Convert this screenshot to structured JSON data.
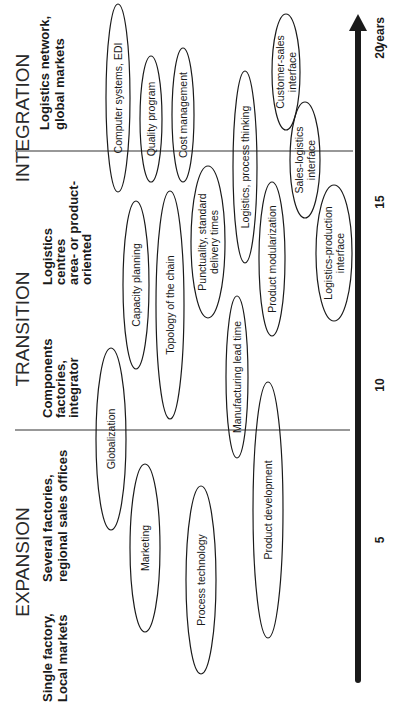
{
  "phases": [
    {
      "id": "expansion",
      "label": "EXPANSION"
    },
    {
      "id": "transition",
      "label": "TRANSITION"
    },
    {
      "id": "integration",
      "label": "INTEGRATION"
    }
  ],
  "stages": [
    {
      "id": "single-factory",
      "lines": [
        "Single  factory,",
        "Local markets"
      ]
    },
    {
      "id": "several-factories",
      "lines": [
        "Several factories,",
        "regional sales offices"
      ]
    },
    {
      "id": "components-factories",
      "lines": [
        "Components",
        "factories,",
        "integrator"
      ]
    },
    {
      "id": "logistics-centres",
      "lines": [
        "Logistics",
        "centres",
        "area- or product-",
        "oriented"
      ]
    },
    {
      "id": "logistics-network",
      "lines": [
        "Logistics network,",
        "global markets"
      ]
    }
  ],
  "axis": {
    "unit_label": "years",
    "ticks": [
      "5",
      "10",
      "15",
      "20"
    ],
    "range_years": [
      0,
      21
    ],
    "color": "#1a1a1a"
  },
  "dividers_at_years": [
    9.5,
    17
  ],
  "topics": [
    {
      "id": "computer-systems",
      "lines": [
        "Computer systems, EDI"
      ]
    },
    {
      "id": "quality-program",
      "lines": [
        "Quality program"
      ]
    },
    {
      "id": "cost-management",
      "lines": [
        "Cost management"
      ]
    },
    {
      "id": "logistics-process-thinking",
      "lines": [
        "Logistics, process thinking"
      ]
    },
    {
      "id": "customer-sales-interface",
      "lines": [
        "Customer-sales",
        "interface"
      ]
    },
    {
      "id": "sales-logistics-interface",
      "lines": [
        "Sales-logistics",
        "interface"
      ]
    },
    {
      "id": "logistics-production-interface",
      "lines": [
        "Logistics-production",
        "interface"
      ]
    },
    {
      "id": "product-modularization",
      "lines": [
        "Product modularization"
      ]
    },
    {
      "id": "punctuality",
      "lines": [
        "Punctuality, standard",
        "delivery times"
      ]
    },
    {
      "id": "capacity-planning",
      "lines": [
        "Capacity planning"
      ]
    },
    {
      "id": "topology-of-chain",
      "lines": [
        "Topology of the chain"
      ]
    },
    {
      "id": "manufacturing-lead-time",
      "lines": [
        "Manufacturing lead time"
      ]
    },
    {
      "id": "globalization",
      "lines": [
        "Globalization"
      ]
    },
    {
      "id": "marketing",
      "lines": [
        "Marketing"
      ]
    },
    {
      "id": "process-technology",
      "lines": [
        "Process technology"
      ]
    },
    {
      "id": "product-development",
      "lines": [
        "Product development"
      ]
    }
  ]
}
